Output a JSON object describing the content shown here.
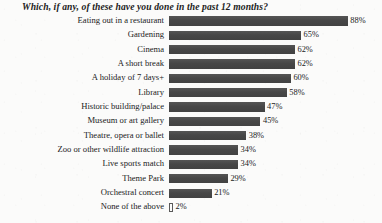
{
  "chart_data": {
    "type": "bar",
    "orientation": "horizontal",
    "title": "Which, if any, of these have you done in the past 12 months?",
    "xlabel": "",
    "ylabel": "",
    "xlim": [
      0,
      100
    ],
    "grid": false,
    "legend": false,
    "value_suffix": "%",
    "bar_color": "#4b4b4b",
    "background_color": "#fbfbfa",
    "text_color": "#1a1a1a",
    "categories": [
      "Eating out in a restaurant",
      "Gardening",
      "Cinema",
      "A short break",
      "A holiday of 7 days+",
      "Library",
      "Historic building/palace",
      "Museum or art gallery",
      "Theatre, opera or ballet",
      "Zoo or other wildlife attraction",
      "Live sports match",
      "Theme Park",
      "Orchestral concert",
      "None of the above"
    ],
    "values": [
      88,
      65,
      62,
      62,
      60,
      58,
      47,
      45,
      38,
      34,
      34,
      29,
      21,
      2
    ],
    "value_labels": [
      "88%",
      "65%",
      "62%",
      "62%",
      "60%",
      "58%",
      "47%",
      "45%",
      "38%",
      "34%",
      "34%",
      "29%",
      "21%",
      "2%"
    ]
  }
}
